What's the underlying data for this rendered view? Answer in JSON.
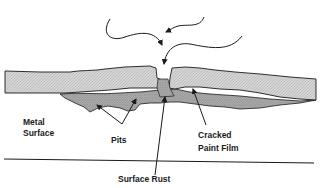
{
  "diagram": {
    "labels": {
      "metal_surface_line1": "Metal",
      "metal_surface_line2": "Surface",
      "pits": "Pits",
      "cracked_paint_line1": "Cracked",
      "paint_film_line2": "Paint Film",
      "surface_rust": "Surface Rust"
    },
    "colors": {
      "paint_film": "#d2d2d2",
      "rust": "#a8a8a8",
      "ink": "#1a1a1a",
      "background": "#ffffff"
    },
    "arrows": {
      "incoming_moisture_count": 3
    }
  }
}
